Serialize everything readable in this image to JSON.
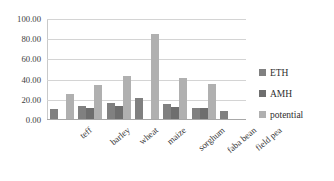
{
  "chart_data": {
    "type": "bar",
    "title": "",
    "subtitle": "",
    "xlabel": "",
    "ylabel": "",
    "ylim": [
      0,
      100
    ],
    "ytick_labels": [
      "100.00",
      "80.00",
      "60.00",
      "40.00",
      "20.00",
      "0.00"
    ],
    "ytick_values": [
      100,
      80,
      60,
      40,
      20,
      0
    ],
    "grid": "horizontal",
    "legend_position": "right",
    "categories": [
      "teff",
      "barley",
      "wheat",
      "maize",
      "sorghum",
      "faba bean",
      "field pea"
    ],
    "series": [
      {
        "name": "ETH",
        "color": "#808080",
        "values": [
          10,
          13,
          16,
          21,
          15,
          11,
          8
        ]
      },
      {
        "name": "AMH",
        "color": "#6e6e6e",
        "values": [
          0,
          11,
          13,
          0,
          12,
          11,
          0
        ]
      },
      {
        "name": "potential",
        "color": "#b0b0b0",
        "values": [
          25,
          34,
          43,
          84,
          41,
          35,
          0
        ]
      }
    ]
  },
  "legend": {
    "items": [
      {
        "label": "ETH"
      },
      {
        "label": "AMH"
      },
      {
        "label": "potential"
      }
    ]
  }
}
